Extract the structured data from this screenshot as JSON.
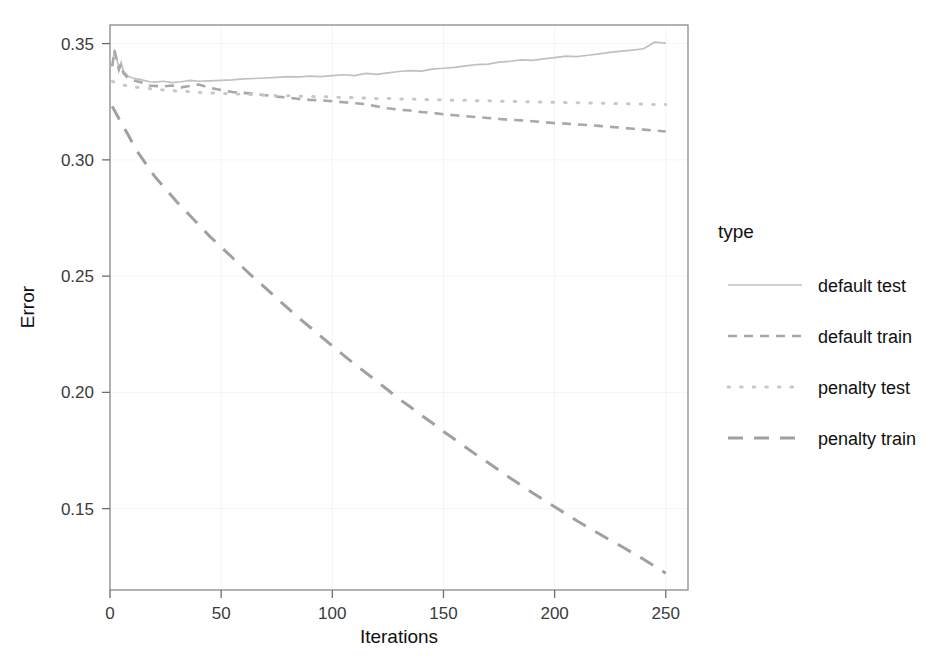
{
  "chart_data": {
    "type": "line",
    "title": "",
    "xlabel": "Iterations",
    "ylabel": "Error",
    "xlim": [
      0,
      260
    ],
    "ylim": [
      0.115,
      0.358
    ],
    "xticks": [
      0,
      50,
      100,
      150,
      200,
      250
    ],
    "xtick_labels": [
      "0",
      "50",
      "100",
      "150",
      "200",
      "250"
    ],
    "yticks": [
      0.15,
      0.2,
      0.25,
      0.3,
      0.35
    ],
    "ytick_labels": [
      "0.15",
      "0.20",
      "0.25",
      "0.30",
      "0.35"
    ],
    "grid": "faint-white-on-white",
    "legend_position": "right",
    "legend_title": "type",
    "series": [
      {
        "name": "default test",
        "linestyle": "solid",
        "color": "#c0c0c0",
        "x": [
          1,
          2,
          3,
          4,
          5,
          6,
          7,
          8,
          10,
          12,
          14,
          16,
          18,
          20,
          24,
          28,
          32,
          36,
          40,
          45,
          50,
          55,
          60,
          65,
          70,
          75,
          80,
          85,
          90,
          95,
          100,
          105,
          110,
          115,
          120,
          125,
          130,
          135,
          140,
          145,
          150,
          155,
          160,
          165,
          170,
          175,
          180,
          185,
          190,
          195,
          200,
          205,
          210,
          215,
          220,
          225,
          230,
          235,
          240,
          245,
          250
        ],
        "values": [
          0.3405,
          0.3475,
          0.3438,
          0.3395,
          0.342,
          0.3382,
          0.3372,
          0.336,
          0.3352,
          0.3348,
          0.3345,
          0.334,
          0.3336,
          0.3334,
          0.3338,
          0.3332,
          0.3336,
          0.3342,
          0.3338,
          0.334,
          0.3342,
          0.3344,
          0.3348,
          0.335,
          0.3352,
          0.3355,
          0.3358,
          0.3357,
          0.336,
          0.3358,
          0.3362,
          0.3366,
          0.3362,
          0.3372,
          0.3368,
          0.3374,
          0.338,
          0.3384,
          0.3382,
          0.339,
          0.3394,
          0.3398,
          0.3404,
          0.341,
          0.3412,
          0.342,
          0.3424,
          0.343,
          0.3428,
          0.3434,
          0.344,
          0.3446,
          0.3444,
          0.345,
          0.3456,
          0.3462,
          0.3468,
          0.3472,
          0.3478,
          0.3506,
          0.3502
        ]
      },
      {
        "name": "default train",
        "linestyle": "dashed",
        "color": "#a8a8a8",
        "x": [
          1,
          2,
          3,
          4,
          5,
          6,
          8,
          10,
          12,
          14,
          16,
          18,
          20,
          24,
          28,
          32,
          36,
          40,
          45,
          50,
          55,
          60,
          65,
          70,
          75,
          80,
          85,
          90,
          95,
          100,
          105,
          110,
          115,
          120,
          125,
          130,
          135,
          140,
          145,
          150,
          155,
          160,
          165,
          170,
          175,
          180,
          185,
          190,
          195,
          200,
          205,
          210,
          215,
          220,
          225,
          230,
          235,
          240,
          245,
          250
        ],
        "values": [
          0.3402,
          0.347,
          0.343,
          0.3388,
          0.3412,
          0.3374,
          0.3352,
          0.3344,
          0.3338,
          0.3334,
          0.3328,
          0.332,
          0.3318,
          0.3316,
          0.332,
          0.3312,
          0.3318,
          0.3324,
          0.331,
          0.33,
          0.3292,
          0.3288,
          0.3284,
          0.3278,
          0.3272,
          0.3268,
          0.3262,
          0.3258,
          0.3256,
          0.3252,
          0.3248,
          0.3244,
          0.324,
          0.323,
          0.3222,
          0.3216,
          0.3212,
          0.3206,
          0.3202,
          0.3196,
          0.3192,
          0.3188,
          0.3184,
          0.318,
          0.3176,
          0.3172,
          0.317,
          0.3166,
          0.3162,
          0.3158,
          0.3156,
          0.3152,
          0.315,
          0.3146,
          0.3142,
          0.3138,
          0.3134,
          0.313,
          0.3126,
          0.3122
        ]
      },
      {
        "name": "penalty test",
        "linestyle": "dotted",
        "color": "#c8c8c8",
        "x": [
          1,
          3,
          5,
          8,
          12,
          16,
          20,
          25,
          30,
          35,
          40,
          45,
          50,
          55,
          60,
          65,
          70,
          75,
          80,
          85,
          90,
          95,
          100,
          105,
          110,
          115,
          120,
          125,
          130,
          135,
          140,
          145,
          150,
          155,
          160,
          165,
          170,
          175,
          180,
          185,
          190,
          195,
          200,
          205,
          210,
          215,
          220,
          225,
          230,
          235,
          240,
          245,
          250
        ],
        "values": [
          0.3338,
          0.333,
          0.3324,
          0.3318,
          0.3312,
          0.3308,
          0.3304,
          0.33,
          0.3296,
          0.3294,
          0.329,
          0.3288,
          0.3286,
          0.3284,
          0.3282,
          0.328,
          0.3278,
          0.3276,
          0.3276,
          0.3274,
          0.3272,
          0.3272,
          0.327,
          0.3268,
          0.3268,
          0.3266,
          0.3264,
          0.3264,
          0.3262,
          0.3262,
          0.326,
          0.3258,
          0.3258,
          0.3256,
          0.3256,
          0.3254,
          0.3254,
          0.3252,
          0.3252,
          0.325,
          0.325,
          0.3248,
          0.3248,
          0.3246,
          0.3246,
          0.3244,
          0.3244,
          0.3242,
          0.3242,
          0.324,
          0.324,
          0.3238,
          0.3238
        ]
      },
      {
        "name": "penalty train",
        "linestyle": "longdash",
        "color": "#a0a0a0",
        "x": [
          1,
          3,
          5,
          8,
          12,
          16,
          20,
          25,
          30,
          35,
          40,
          45,
          50,
          55,
          60,
          65,
          70,
          75,
          80,
          85,
          90,
          95,
          100,
          105,
          110,
          115,
          120,
          125,
          130,
          135,
          140,
          145,
          150,
          155,
          160,
          165,
          170,
          175,
          180,
          185,
          190,
          195,
          200,
          205,
          210,
          215,
          220,
          225,
          230,
          235,
          240,
          245,
          250
        ],
        "values": [
          0.323,
          0.3195,
          0.316,
          0.311,
          0.304,
          0.2985,
          0.293,
          0.2875,
          0.282,
          0.277,
          0.272,
          0.267,
          0.2625,
          0.258,
          0.2535,
          0.249,
          0.2448,
          0.2405,
          0.2362,
          0.232,
          0.228,
          0.224,
          0.22,
          0.216,
          0.2122,
          0.2085,
          0.2048,
          0.201,
          0.1972,
          0.1938,
          0.1902,
          0.1868,
          0.1832,
          0.1798,
          0.1764,
          0.173,
          0.1698,
          0.1665,
          0.1632,
          0.16,
          0.1568,
          0.1538,
          0.1508,
          0.1478,
          0.1448,
          0.142,
          0.1392,
          0.1364,
          0.1338,
          0.131,
          0.1282,
          0.1252,
          0.1222
        ]
      }
    ]
  },
  "legend": {
    "title": "type",
    "entries": [
      {
        "label": "default test",
        "key": "default-test"
      },
      {
        "label": "default train",
        "key": "default-train"
      },
      {
        "label": "penalty test",
        "key": "penalty-test"
      },
      {
        "label": "penalty train",
        "key": "penalty-train"
      }
    ]
  },
  "axes": {
    "x_title": "Iterations",
    "y_title": "Error"
  }
}
